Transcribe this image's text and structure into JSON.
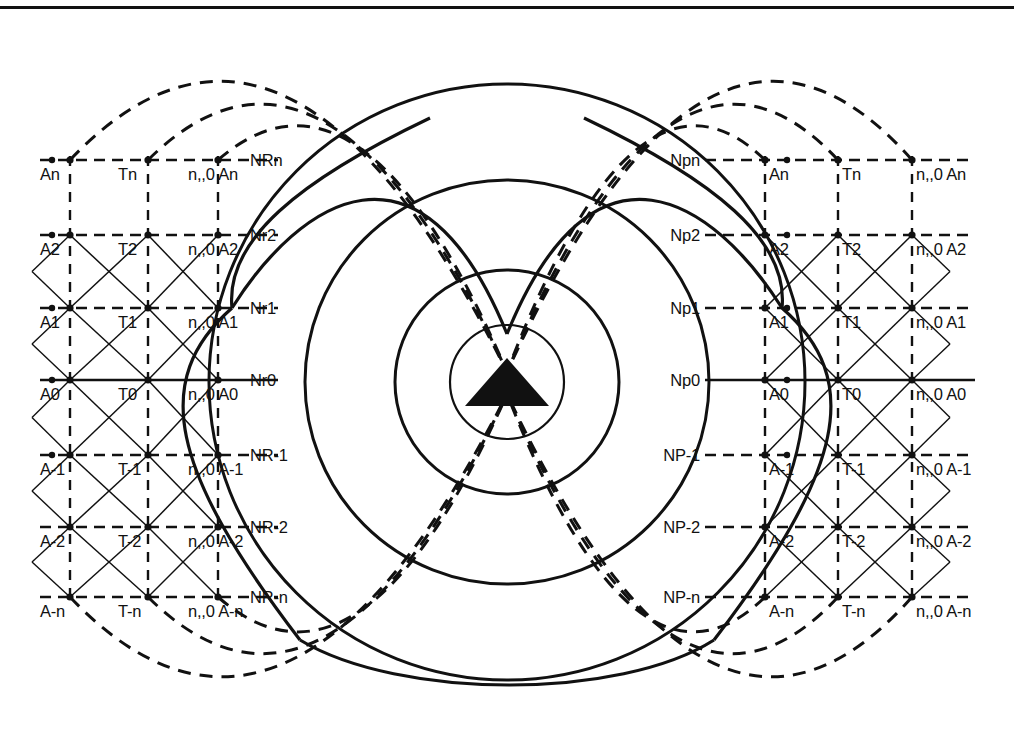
{
  "figure": {
    "type": "technical-line-diagram",
    "background": "#ffffff",
    "stroke_color": "#111111",
    "rule_top_y": 6
  },
  "center_marker": {
    "name": "filled-triangle",
    "cx": 507,
    "cy": 382,
    "half_width": 42,
    "height": 48,
    "fill": "#111111"
  },
  "circles": {
    "note": "concentric solid circles centred on the triangle apex",
    "cx": 507,
    "cy": 382,
    "radii": [
      57,
      112,
      202,
      298
    ]
  },
  "dashed_arcs": {
    "note": "large dashed arcs converging at the triangle apex",
    "left_origins_x": [
      70,
      148,
      218
    ],
    "right_origins_x": [
      765,
      838,
      912
    ],
    "apex_x": 507,
    "apex_y": 372
  },
  "grid": {
    "left": {
      "columns_x": [
        70,
        148,
        218
      ],
      "rows_y": [
        160,
        235,
        308,
        380,
        455,
        527,
        597
      ],
      "row_labels": [
        "NRn",
        "Nr2",
        "Nr1",
        "Nr0",
        "NR-1",
        "NR-2",
        "NR-n"
      ],
      "row_label_x": 250,
      "cell_labels": [
        [
          "An",
          "Tn",
          "n,,0 An"
        ],
        [
          "A2",
          "T2",
          "n,,0 A2"
        ],
        [
          "A1",
          "T1",
          "n,,0 A1"
        ],
        [
          "A0",
          "T0",
          "n,,0 A0"
        ],
        [
          "A-1",
          "T-1",
          "n,,0 A-1"
        ],
        [
          "A-2",
          "T-2",
          "n,,0 A-2"
        ],
        [
          "A-n",
          "T-n",
          "n,,0 A-n"
        ]
      ]
    },
    "right": {
      "columns_x": [
        765,
        838,
        912
      ],
      "rows_y": [
        160,
        235,
        308,
        380,
        455,
        527,
        597
      ],
      "row_labels": [
        "Npn",
        "Np2",
        "Np1",
        "Np0",
        "NP-1",
        "NP-2",
        "NP-n"
      ],
      "row_label_x": 700,
      "cell_labels": [
        [
          "An",
          "Tn",
          "n,,0 An"
        ],
        [
          "A2",
          "T2",
          "n,,0 A2"
        ],
        [
          "A1",
          "T1",
          "n,,0 A1"
        ],
        [
          "A0",
          "T0",
          "n,,0 A0"
        ],
        [
          "A-1",
          "T-1",
          "n,,0 A-1"
        ],
        [
          "A-2",
          "T-2",
          "n,,0 A-2"
        ],
        [
          "A-n",
          "T-n",
          "n,,0 A-n"
        ]
      ]
    }
  },
  "labels_flat": {
    "left_rows": [
      "NRn",
      "Nr2",
      "Nr1",
      "Nr0",
      "NR-1",
      "NR-2",
      "NR-n"
    ],
    "right_rows": [
      "Npn",
      "Np2",
      "Np1",
      "Np0",
      "NP-1",
      "NP-2",
      "NP-n"
    ],
    "left_cells": [
      "An",
      "Tn",
      "n,,0 An",
      "A2",
      "T2",
      "n,,0 A2",
      "A1",
      "T1",
      "n,,0 A1",
      "A0",
      "T0",
      "n,,0 A0",
      "A-1",
      "T-1",
      "n,,0 A-1",
      "A-2",
      "T-2",
      "n,,0 A-2",
      "A-n",
      "T-n",
      "n,,0 A-n"
    ],
    "right_cells": [
      "An",
      "Tn",
      "n,,0 An",
      "A2",
      "T2",
      "n,,0 A2",
      "A1",
      "T1",
      "n,,0 A1",
      "A0",
      "T0",
      "n,,0 A0",
      "A-1",
      "T-1",
      "n,,0 A-1",
      "A-2",
      "T-2",
      "n,,0 A-2",
      "A-n",
      "T-n",
      "n,,0 A-n"
    ]
  }
}
